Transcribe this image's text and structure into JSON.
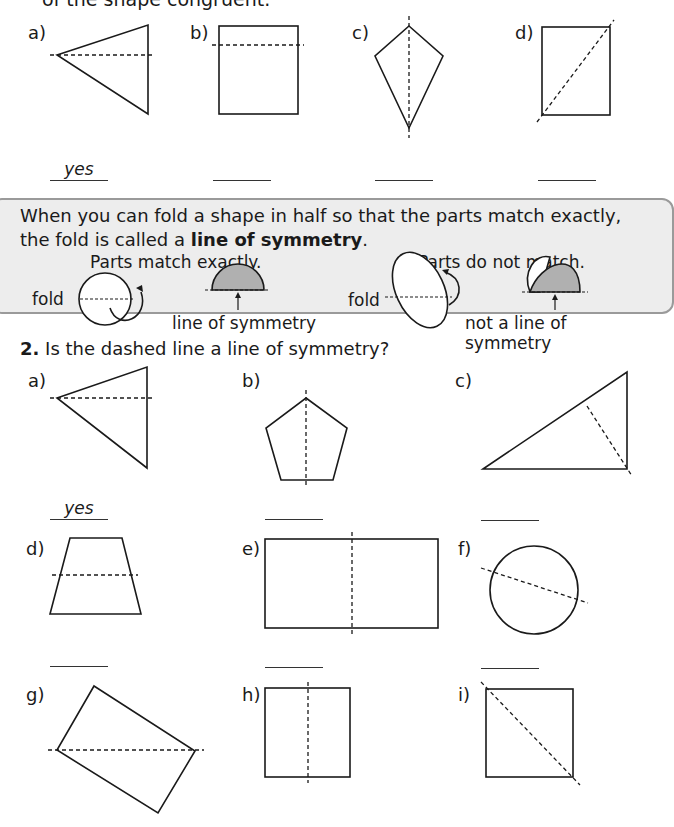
{
  "intro_text": "of the shape congruent.",
  "q1": {
    "items": [
      {
        "label": "a)",
        "answer": "yes",
        "shape": "triangle",
        "line": "horizontal"
      },
      {
        "label": "b)",
        "answer": "",
        "shape": "square",
        "line": "horizontal-off-center"
      },
      {
        "label": "c)",
        "answer": "",
        "shape": "kite",
        "line": "vertical"
      },
      {
        "label": "d)",
        "answer": "",
        "shape": "square",
        "line": "diagonal"
      }
    ]
  },
  "info_box": {
    "text_before": "When you can fold a shape in half so that the parts match exactly, the fold is called a ",
    "term": "line of symmetry",
    "text_after": ".",
    "match_heading": "Parts match exactly.",
    "nomatch_heading": "Parts do not match.",
    "fold_label": "fold",
    "fold_label_2": "fold",
    "match_caption": "line of symmetry",
    "nomatch_caption": "not a line of symmetry"
  },
  "q2": {
    "number": "2.",
    "question": "Is the dashed line a line of symmetry?",
    "items": [
      {
        "label": "a)",
        "answer": "yes",
        "shape": "triangle"
      },
      {
        "label": "b)",
        "answer": "",
        "shape": "pentagon"
      },
      {
        "label": "c)",
        "answer": "",
        "shape": "right-triangle"
      },
      {
        "label": "d)",
        "answer": "",
        "shape": "trapezoid"
      },
      {
        "label": "e)",
        "answer": "",
        "shape": "rectangle"
      },
      {
        "label": "f)",
        "answer": "",
        "shape": "circle"
      },
      {
        "label": "g)",
        "answer": "",
        "shape": "rotated-rectangle"
      },
      {
        "label": "h)",
        "answer": "",
        "shape": "rectangle"
      },
      {
        "label": "i)",
        "answer": "",
        "shape": "square"
      }
    ]
  }
}
